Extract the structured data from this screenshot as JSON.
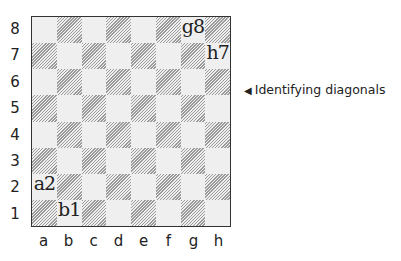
{
  "board": {
    "files": [
      "a",
      "b",
      "c",
      "d",
      "e",
      "f",
      "g",
      "h"
    ],
    "ranks": [
      "8",
      "7",
      "6",
      "5",
      "4",
      "3",
      "2",
      "1"
    ],
    "highlighted_squares": [
      {
        "square": "g8",
        "label": "g8"
      },
      {
        "square": "h7",
        "label": "h7"
      },
      {
        "square": "a2",
        "label": "a2"
      },
      {
        "square": "b1",
        "label": "b1"
      }
    ],
    "colors": {
      "light": "#efefef",
      "dark_hatch": "#9a9a9a",
      "border": "#333333"
    }
  },
  "caption": {
    "arrow": "◀",
    "text": "Identifying diagonals"
  }
}
